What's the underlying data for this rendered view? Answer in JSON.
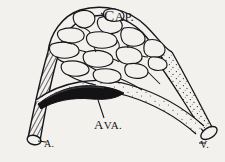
{
  "figure": {
    "background_color": "#f2f1ee",
    "ink_color": "#17161a",
    "labels": {
      "capillaries": "Cap.",
      "capillaries_lead": "C",
      "capillaries_rest": "AP.",
      "anastomosis": "Ava.",
      "anastomosis_lead": "A",
      "anastomosis_rest": "VA.",
      "artery": "A.",
      "vein": "V."
    },
    "structures": [
      {
        "name": "arteriole",
        "label": "A.",
        "texture": "cross-hatched",
        "position": "lower-left"
      },
      {
        "name": "venule",
        "label": "V.",
        "texture": "stippled",
        "position": "lower-right"
      },
      {
        "name": "arteriovenous-anastomosis",
        "label": "Ava.",
        "texture": "solid-dark",
        "position": "lower-center"
      },
      {
        "name": "capillary-network",
        "label": "Cap.",
        "texture": "open-loops",
        "position": "upper-arch"
      }
    ]
  }
}
